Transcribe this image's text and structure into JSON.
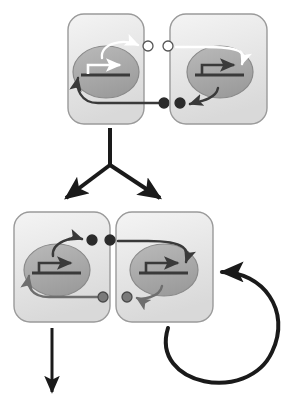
{
  "diagram": {
    "type": "biological-schematic",
    "canvas": {
      "width": 293,
      "height": 404
    },
    "colors": {
      "cell_fill_light": "#ebebeb",
      "cell_fill_dark": "#d9d9d9",
      "cell_border": "#9a9a9a",
      "nucleus_fill": "#ababab",
      "nucleus_fill_dark": "#9b9b9b",
      "nucleus_border": "#8a8a8a",
      "arrow_dark": "#3a3a3a",
      "arrow_gray": "#6e6e6e",
      "arrow_white": "#ffffff",
      "dot_dark": "#2b2b2b",
      "dot_gray": "#7a7a7a",
      "dot_white": "#ffffff",
      "flow_arrow": "#1a1a1a",
      "gene_bar": "#3a3a3a"
    },
    "rows": [
      {
        "name": "top-row",
        "label": "",
        "cells": [
          {
            "name": "cell-top-left",
            "label": "",
            "x": 68,
            "y": 14,
            "w": 76,
            "h": 110,
            "nucleus": {
              "cx": 106,
              "cy": 72,
              "rx": 33,
              "ry": 26
            },
            "transcription_arrow_color": "#ffffff",
            "gene_bar_color": "#3a3a3a",
            "secretion_arrow_color": "#ffffff",
            "secretion_direction": "up-right",
            "receptor_arrow_color": "#3a3a3a",
            "receptor_direction": "from-lower-right",
            "ligand_dot": {
              "cx": 148,
              "cy": 46,
              "r": 5,
              "fill": "#ffffff",
              "stroke": "#555555"
            },
            "receptor_dot": {
              "cx": 164,
              "cy": 103,
              "r": 5,
              "fill": "#2b2b2b",
              "stroke": "#2b2b2b"
            }
          },
          {
            "name": "cell-top-right",
            "label": "",
            "x": 170,
            "y": 14,
            "w": 97,
            "h": 110,
            "nucleus": {
              "cx": 220,
              "cy": 72,
              "rx": 33,
              "ry": 26
            },
            "transcription_arrow_color": "#3a3a3a",
            "gene_bar_color": "#3a3a3a",
            "secretion_arrow_color": "#3a3a3a",
            "secretion_direction": "down-left",
            "receptor_arrow_color": "#ffffff",
            "receptor_direction": "from-upper-left",
            "ligand_dot": {
              "cx": 168,
              "cy": 46,
              "r": 5,
              "fill": "#ffffff",
              "stroke": "#555555"
            },
            "receptor_dot": {
              "cx": 180,
              "cy": 103,
              "r": 5,
              "fill": "#2b2b2b",
              "stroke": "#2b2b2b"
            }
          }
        ]
      },
      {
        "name": "bottom-row",
        "label": "",
        "cells": [
          {
            "name": "cell-bottom-left",
            "label": "",
            "x": 14,
            "y": 212,
            "w": 96,
            "h": 110,
            "nucleus": {
              "cx": 57,
              "cy": 270,
              "rx": 33,
              "ry": 26
            },
            "transcription_arrow_color": "#3a3a3a",
            "gene_bar_color": "#3a3a3a",
            "secretion_arrow_color": "#3a3a3a",
            "secretion_direction": "up-right",
            "receptor_arrow_color": "#6e6e6e",
            "receptor_direction": "from-lower-right",
            "ligand_dot": {
              "cx": 92,
              "cy": 240,
              "r": 5,
              "fill": "#2b2b2b",
              "stroke": "#2b2b2b"
            },
            "receptor_dot": {
              "cx": 103,
              "cy": 297,
              "r": 5,
              "fill": "#7a7a7a",
              "stroke": "#4a4a4a"
            }
          },
          {
            "name": "cell-bottom-right",
            "label": "",
            "x": 116,
            "y": 212,
            "w": 97,
            "h": 110,
            "nucleus": {
              "cx": 164,
              "cy": 270,
              "rx": 34,
              "ry": 26
            },
            "transcription_arrow_color": "#3a3a3a",
            "gene_bar_color": "#3a3a3a",
            "secretion_arrow_color": "#6e6e6e",
            "secretion_direction": "down-left",
            "receptor_arrow_color": "#3a3a3a",
            "receptor_direction": "from-upper-left",
            "ligand_dot": {
              "cx": 110,
              "cy": 240,
              "r": 5,
              "fill": "#2b2b2b",
              "stroke": "#2b2b2b"
            },
            "receptor_dot": {
              "cx": 127,
              "cy": 297,
              "r": 5,
              "fill": "#7a7a7a",
              "stroke": "#4a4a4a"
            }
          }
        ]
      }
    ],
    "connectors": [
      {
        "name": "branch-arrow-down",
        "label": "",
        "kind": "y-branch",
        "stem": {
          "x": 110,
          "y1": 128,
          "y2": 165
        },
        "left_end": {
          "x": 66,
          "y": 198
        },
        "right_end": {
          "x": 160,
          "y": 198
        },
        "color": "#1a1a1a",
        "width": 4
      },
      {
        "name": "output-arrow-down",
        "label": "",
        "kind": "straight",
        "x": 52,
        "y1": 328,
        "y2": 392,
        "color": "#1a1a1a",
        "width": 3
      },
      {
        "name": "feedback-loop-arrow",
        "label": "",
        "kind": "circular-loop",
        "color": "#1a1a1a",
        "width": 4
      }
    ]
  }
}
